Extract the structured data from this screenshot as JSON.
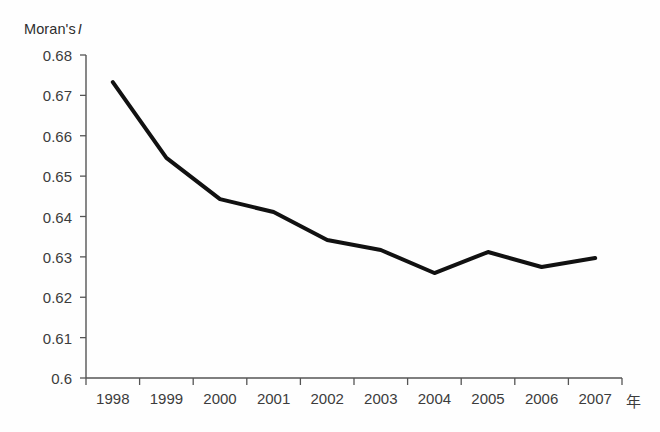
{
  "chart_data": {
    "type": "line",
    "title": "",
    "subtitle": "",
    "ylabel": "Moran's",
    "ylabel_italic": "I",
    "xlabel": "年",
    "categories": [
      "1998",
      "1999",
      "2000",
      "2001",
      "2002",
      "2003",
      "2004",
      "2005",
      "2006",
      "2007"
    ],
    "series": [
      {
        "name": "Moran's I",
        "values": [
          0.6733,
          0.6545,
          0.6443,
          0.6411,
          0.6342,
          0.6317,
          0.626,
          0.6312,
          0.6275,
          0.6297
        ],
        "color": "#111111",
        "line_width": 4,
        "markers": false
      }
    ],
    "ylim": [
      0.6,
      0.68
    ],
    "ytick_step": 0.01,
    "ytick_labels": [
      "0.6",
      "0.61",
      "0.62",
      "0.63",
      "0.64",
      "0.65",
      "0.66",
      "0.67",
      "0.68"
    ],
    "ytick_values": [
      0.6,
      0.61,
      0.62,
      0.63,
      0.64,
      0.65,
      0.66,
      0.67,
      0.68
    ],
    "grid": false,
    "legend": false,
    "legend_position": "none",
    "axis_color": "#555555",
    "background": "#fefefe"
  },
  "figure": {
    "plot_left_px": 86,
    "plot_right_px": 622,
    "plot_top_px": 55,
    "plot_bottom_px": 378
  }
}
